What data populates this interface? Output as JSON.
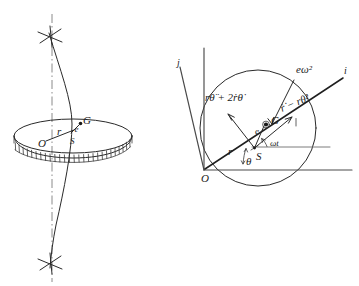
{
  "figure": {
    "ink_color": "#2a2a2a",
    "background_color": "#ffffff",
    "axis_color": "#4a4a4a",
    "centerline_color": "#7d7d7d"
  },
  "left_panel": {
    "name": "rotating-disk-pictorial",
    "labels": {
      "origin": "O",
      "radius": "r",
      "eccentricity": "e",
      "slider": "S",
      "center_of_mass": "G"
    },
    "elements": {
      "disk": "elliptical disk in perspective with serrated rim",
      "spin_axis": "vertical dash-dot centerline",
      "bent_shaft": "curved shaft through disk",
      "top_marker": "asterisk-bearing-support",
      "bottom_marker": "asterisk-bearing-support"
    }
  },
  "right_panel": {
    "name": "polar-acceleration-diagram",
    "labels": {
      "origin": "O",
      "slider": "S",
      "center_of_mass": "G",
      "eccentricity": "e",
      "radius": "r",
      "theta_angle": "θ",
      "omega_t_angle": "ωt",
      "axis_i": "i",
      "axis_j": "j"
    },
    "vectors": [
      {
        "name": "transverse-acceleration",
        "label": "rθ̈ + 2ṙθ̇",
        "direction": "up-left, perpendicular to r"
      },
      {
        "name": "radial-acceleration",
        "label": "ṙ̇ − rθ̇²",
        "direction": "outward along r"
      },
      {
        "name": "centripetal-acceleration-of-G",
        "label": "eω²",
        "direction": "from G toward S"
      }
    ],
    "elements": {
      "circle": "construction circle through O and S",
      "vertical_axis": "vertical reference axis",
      "horizontal_axis": "horizontal reference axis through O",
      "reference_line": "horizontal reference line through S"
    }
  }
}
